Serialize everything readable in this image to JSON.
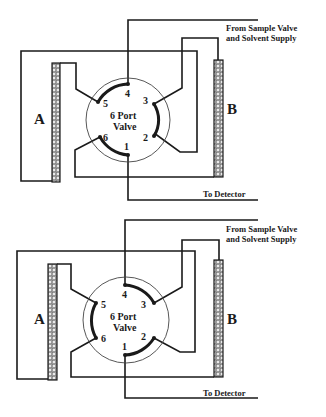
{
  "diagrams": [
    {
      "id": "position-1",
      "column_left": "A",
      "column_right": "B",
      "valve_label_line1": "6 Port",
      "valve_label_line2": "Valve",
      "ports": [
        "1",
        "2",
        "3",
        "4",
        "5",
        "6"
      ],
      "inlet_label_line1": "From Sample Valve",
      "inlet_label_line2": "and Solvent Supply",
      "outlet_label": "To Detector",
      "connections": [
        "4-5",
        "3-2",
        "6-1"
      ]
    },
    {
      "id": "position-2",
      "column_left": "A",
      "column_right": "B",
      "valve_label_line1": "6 Port",
      "valve_label_line2": "Valve",
      "ports": [
        "1",
        "2",
        "3",
        "4",
        "5",
        "6"
      ],
      "inlet_label_line1": "From Sample Valve",
      "inlet_label_line2": "and Solvent Supply",
      "outlet_label": "To Detector",
      "connections": [
        "4-3",
        "5-6",
        "1-2"
      ]
    }
  ],
  "colors": {
    "ink": "#1a1a1a",
    "background": "#ffffff",
    "column_fill": "#8a8a8a"
  }
}
